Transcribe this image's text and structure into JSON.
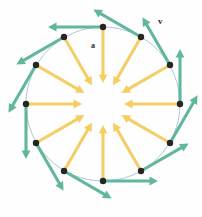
{
  "figure": {
    "background_color": "#fefefe",
    "labels": {
      "velocity": "v",
      "acceleration": "a"
    },
    "colors": {
      "velocity_vector": "#62b79a",
      "acceleration_vector": "#f3ce63",
      "orbit_circle": "#9cc3dc",
      "point_marker": "#262626",
      "label_text": "#2b2b2b"
    }
  },
  "chart_data": {
    "type": "scatter",
    "xlabel": "",
    "ylabel": "",
    "grid": false,
    "legend_position": "inline-annotations",
    "annotations": [
      {
        "text": "v",
        "x": 158,
        "y": 21,
        "meaning": "velocity vector label"
      },
      {
        "text": "a",
        "x": 93,
        "y": 46,
        "meaning": "acceleration vector label"
      }
    ],
    "circle": {
      "center_x": 103,
      "center_y": 104,
      "radius": 77,
      "stroke": "#9cc3dc",
      "stroke_width": 0.9,
      "fill": "none"
    },
    "n_points": 12,
    "angle_step_deg": 30,
    "series": [
      {
        "name": "position markers",
        "marker": "filled-circle",
        "color": "#262626",
        "radius_px": 3.2,
        "points": [
          {
            "angle_deg": 90,
            "x": 103,
            "y": 27
          },
          {
            "angle_deg": 60,
            "x": 141,
            "y": 37
          },
          {
            "angle_deg": 30,
            "x": 170,
            "y": 65
          },
          {
            "angle_deg": 0,
            "x": 180,
            "y": 104
          },
          {
            "angle_deg": 330,
            "x": 170,
            "y": 143
          },
          {
            "angle_deg": 300,
            "x": 141,
            "y": 171
          },
          {
            "angle_deg": 270,
            "x": 103,
            "y": 181
          },
          {
            "angle_deg": 240,
            "x": 64,
            "y": 171
          },
          {
            "angle_deg": 210,
            "x": 36,
            "y": 143
          },
          {
            "angle_deg": 180,
            "x": 26,
            "y": 104
          },
          {
            "angle_deg": 150,
            "x": 36,
            "y": 65
          },
          {
            "angle_deg": 120,
            "x": 64,
            "y": 37
          }
        ]
      },
      {
        "name": "velocity vectors (tangential, clockwise)",
        "color": "#62b79a",
        "length_px": 55,
        "stroke_width": 3.1,
        "direction": "tangent-clockwise",
        "arrowhead": "solid-triangle"
      },
      {
        "name": "acceleration vectors (centripetal)",
        "color": "#f3ce63",
        "length_px": 56,
        "stroke_width": 3.0,
        "direction": "toward-center",
        "arrowhead": "solid-triangle"
      }
    ]
  }
}
